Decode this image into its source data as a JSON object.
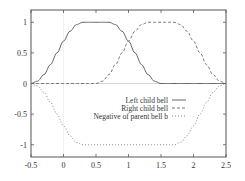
{
  "chart_data": {
    "type": "line",
    "title": "",
    "xlabel": "",
    "ylabel": "",
    "xlim": [
      -0.5,
      2.5
    ],
    "ylim": [
      -1.2,
      1.2
    ],
    "grid": false,
    "zero_axes": true,
    "legend_position": "center-right",
    "x_ticks": [
      -0.5,
      0,
      0.5,
      1,
      1.5,
      2,
      2.5
    ],
    "x_tick_labels": [
      "-0.5",
      "0",
      "0.5",
      "1",
      "1.5",
      "2",
      "2.5"
    ],
    "y_ticks": [
      -1,
      -0.5,
      0,
      0.5,
      1
    ],
    "y_tick_labels": [
      "-1",
      "-0.5",
      "0",
      "0.5",
      "1"
    ],
    "x": [
      -0.5,
      -0.4,
      -0.3,
      -0.2,
      -0.1,
      0,
      0.1,
      0.2,
      0.3,
      0.4,
      0.5,
      0.6,
      0.7,
      0.8,
      0.9,
      1.0,
      1.1,
      1.2,
      1.3,
      1.4,
      1.5,
      1.6,
      1.7,
      1.8,
      1.9,
      2.0,
      2.1,
      2.2,
      2.3,
      2.4,
      2.5
    ],
    "series": [
      {
        "name": "Left child bell",
        "style": "solid",
        "color": "#555555",
        "values": [
          0,
          0.038,
          0.146,
          0.309,
          0.5,
          0.691,
          0.854,
          0.962,
          1,
          1,
          1,
          1,
          1,
          0.962,
          0.854,
          0.691,
          0.5,
          0.309,
          0.146,
          0.038,
          0,
          0,
          0,
          0,
          0,
          0,
          0,
          0,
          0,
          0,
          0
        ]
      },
      {
        "name": "Right child bell",
        "style": "dashed",
        "color": "#666666",
        "values": [
          0,
          0,
          0,
          0,
          0,
          0,
          0,
          0,
          0,
          0,
          0,
          0.038,
          0.146,
          0.309,
          0.5,
          0.691,
          0.854,
          0.962,
          1,
          1,
          1,
          1,
          1,
          0.962,
          0.854,
          0.691,
          0.5,
          0.309,
          0.146,
          0.038,
          0
        ]
      },
      {
        "name": "Negative of parent bell b",
        "style": "dotted",
        "color": "#777777",
        "values": [
          0,
          -0.038,
          -0.146,
          -0.309,
          -0.5,
          -0.691,
          -0.854,
          -0.962,
          -1,
          -1,
          -1,
          -1,
          -1,
          -1,
          -1,
          -1,
          -1,
          -1,
          -1,
          -1,
          -1,
          -1,
          -1,
          -0.962,
          -0.854,
          -0.691,
          -0.5,
          -0.309,
          -0.146,
          -0.038,
          0
        ]
      }
    ]
  },
  "legend": {
    "items": [
      {
        "label": "Left child bell"
      },
      {
        "label": "Right child bell"
      },
      {
        "label": "Negative of parent bell b"
      }
    ]
  },
  "colors": {
    "frame": "#555555",
    "zero_axis": "#cccccc",
    "text": "#333333"
  }
}
